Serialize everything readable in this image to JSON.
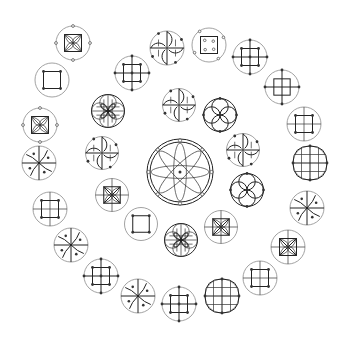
{
  "diagram": {
    "title": "",
    "colors": {
      "background": "#ffffff",
      "ink": "#222222",
      "outline": "#8a8a8a"
    },
    "center": {
      "type": "rosette-8-petal"
    },
    "inner_ring": [
      {
        "type": "swirl-grid"
      },
      {
        "type": "four-circle"
      },
      {
        "type": "swirl-grid"
      },
      {
        "type": "four-circle"
      },
      {
        "type": "square-x-cross"
      },
      {
        "type": "quatrefoil-x"
      },
      {
        "type": "plain-square"
      },
      {
        "type": "square-x-cross"
      },
      {
        "type": "swirl-grid"
      },
      {
        "type": "quatrefoil-x"
      }
    ],
    "outer_ring": [
      {
        "type": "swirl-grid"
      },
      {
        "type": "square-open-dots"
      },
      {
        "type": "dot-grid"
      },
      {
        "type": "square-cross-dots"
      },
      {
        "type": "grid-square"
      },
      {
        "type": "oval-grid"
      },
      {
        "type": "pinwheel"
      },
      {
        "type": "square-x-cross"
      },
      {
        "type": "grid-square"
      },
      {
        "type": "oval-grid"
      },
      {
        "type": "dot-grid"
      },
      {
        "type": "pinwheel"
      },
      {
        "type": "dot-grid"
      },
      {
        "type": "pinwheel"
      },
      {
        "type": "grid-square"
      },
      {
        "type": "pinwheel"
      },
      {
        "type": "square-x-dots"
      },
      {
        "type": "plain-square"
      },
      {
        "type": "square-x-dots"
      },
      {
        "type": "dot-grid"
      }
    ]
  }
}
